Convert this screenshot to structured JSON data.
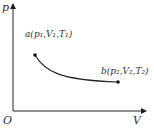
{
  "diagram": {
    "type": "p-V process curve",
    "axes": {
      "y_label": "p",
      "x_label": "V",
      "origin_label": "O"
    },
    "points": [
      {
        "id": "a",
        "label": "a(p₁,V₁,T₁)",
        "x": 35,
        "y": 55
      },
      {
        "id": "b",
        "label": "b(p₂,V₂,T₂)",
        "x": 118,
        "y": 82
      }
    ],
    "colors": {
      "line": "#222222",
      "text": "#333333"
    }
  }
}
